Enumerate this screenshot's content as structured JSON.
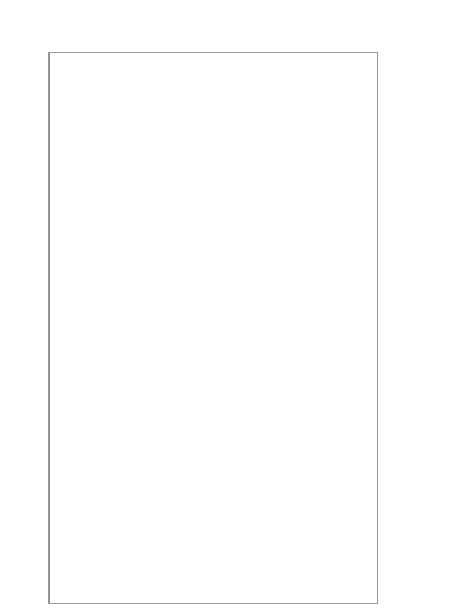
{
  "chart_data": {
    "type": "scatter",
    "subtype": "forest-plot",
    "xlabel": "",
    "ylabel": "",
    "xlim": [
      -6.6,
      6.6
    ],
    "xticks": [
      -6,
      -4,
      -2,
      0,
      2,
      4,
      6
    ],
    "xticklabels": [
      "-6",
      "-4",
      "-2",
      "0",
      "2",
      "4",
      "6"
    ],
    "grid": false,
    "legend": null,
    "reference_line": 0,
    "marker_open": "city-level estimate",
    "marker_filled": "pooled overall estimate",
    "regions": [
      {
        "name": "northwest",
        "label_y": 90
      },
      {
        "name": "southwest",
        "label_y": 155
      },
      {
        "name": "southcal",
        "label_y": 218
      },
      {
        "name": "uppermidwest",
        "label_y": 261
      },
      {
        "name": "industmidwest",
        "label_y": 325
      },
      {
        "name": "northeast",
        "label_y": 432
      },
      {
        "name": "southeast",
        "label_y": 553
      }
    ],
    "region_separators_y": [
      131,
      181,
      230,
      263,
      370,
      452,
      595
    ],
    "points": [
      {
        "city": "seat",
        "est": 0.3,
        "lo": -1.0,
        "hi": 1.5,
        "pooled": false
      },
      {
        "city": "sanj",
        "est": 0.05,
        "lo": -1.4,
        "hi": 1.4,
        "pooled": false
      },
      {
        "city": "oakl",
        "est": 1.75,
        "lo": -0.75,
        "hi": 4.25,
        "pooled": false
      },
      {
        "city": "denv",
        "est": 0.65,
        "lo": -0.9,
        "hi": 2.3,
        "pooled": false
      },
      {
        "city": "sacr",
        "est": -1.2,
        "lo": -3.4,
        "hi": 0.6,
        "pooled": false
      },
      {
        "city": "saff",
        "est": -0.75,
        "lo": -2.5,
        "hi": 0.55,
        "pooled": false
      },
      {
        "city": "taco",
        "est": 0.9,
        "lo": -1.4,
        "hi": 2.95,
        "pooled": false
      },
      {
        "city": "stoc",
        "est": -1.55,
        "lo": -4.0,
        "hi": 1.35,
        "pooled": false
      },
      {
        "city": "colo",
        "est": 3.05,
        "lo": -0.1,
        "hi": 6.7,
        "pooled": false
      },
      {
        "city": "mode",
        "est": -1.9,
        "lo": -5.1,
        "hi": 1.1,
        "pooled": false
      },
      {
        "city": "spok",
        "est": 0.3,
        "lo": -1.0,
        "hi": 1.2,
        "pooled": false
      },
      {
        "city": "olym",
        "est": 0.95,
        "lo": -1.3,
        "hi": 3.2,
        "pooled": false
      },
      {
        "city": "overall",
        "est": 0.22,
        "lo": -0.35,
        "hi": 0.8,
        "pooled": true
      },
      {
        "city": "phoe",
        "est": 0.05,
        "lo": -1.15,
        "hi": 1.3,
        "pooled": false
      },
      {
        "city": "sana",
        "est": 0.75,
        "lo": -0.95,
        "hi": 2.4,
        "pooled": false
      },
      {
        "city": "okla",
        "est": 0.55,
        "lo": -1.5,
        "hi": 1.95,
        "pooled": false
      },
      {
        "city": "elpa",
        "est": 0.2,
        "lo": -1.4,
        "hi": 1.6,
        "pooled": false
      },
      {
        "city": "aust",
        "est": 1.45,
        "lo": -1.65,
        "hi": 4.35,
        "pooled": false
      },
      {
        "city": "albu",
        "est": 0.25,
        "lo": -2.2,
        "hi": 3.9,
        "pooled": false
      },
      {
        "city": "corp",
        "est": -1.55,
        "lo": -4.9,
        "hi": 2.1,
        "pooled": false
      },
      {
        "city": "lubb",
        "est": -1.35,
        "lo": -3.25,
        "hi": 1.75,
        "pooled": false
      },
      {
        "city": "overall",
        "est": 0.3,
        "lo": -0.3,
        "hi": 0.92,
        "pooled": true
      },
      {
        "city": "la",
        "est": 0.18,
        "lo": -0.55,
        "hi": 0.9,
        "pooled": false
      },
      {
        "city": "sand",
        "est": 0.92,
        "lo": -0.7,
        "hi": 2.55,
        "pooled": false
      },
      {
        "city": "staa",
        "est": 0.1,
        "lo": -1.1,
        "hi": 1.35,
        "pooled": false
      },
      {
        "city": "sanb",
        "est": 0.05,
        "lo": -1.6,
        "hi": 1.7,
        "pooled": false
      },
      {
        "city": "rive",
        "est": 0.0,
        "lo": -1.45,
        "hi": 1.45,
        "pooled": false
      },
      {
        "city": "fres",
        "est": 0.7,
        "lo": -1.25,
        "hi": 2.7,
        "pooled": false
      },
      {
        "city": "baku",
        "est": 0.35,
        "lo": -1.7,
        "hi": 2.45,
        "pooled": false
      },
      {
        "city": "overall",
        "est": 0.26,
        "lo": -0.22,
        "hi": 0.75,
        "pooled": true
      },
      {
        "city": "minn",
        "est": 0.45,
        "lo": -0.85,
        "hi": 1.75,
        "pooled": false
      },
      {
        "city": "kans",
        "est": -0.55,
        "lo": -2.05,
        "hi": 0.9,
        "pooled": false
      },
      {
        "city": "wich",
        "est": 0.25,
        "lo": -1.7,
        "hi": 1.15,
        "pooled": false
      },
      {
        "city": "desm",
        "est": 1.25,
        "lo": -2.35,
        "hi": 5.15,
        "pooled": false
      },
      {
        "city": "oama",
        "est": -0.25,
        "lo": -2.5,
        "hi": 1.95,
        "pooled": false
      },
      {
        "city": "tope",
        "est": 0.6,
        "lo": -2.35,
        "hi": 3.35,
        "pooled": false
      },
      {
        "city": "overall",
        "est": 0.16,
        "lo": -0.5,
        "hi": 0.8,
        "pooled": true
      },
      {
        "city": "chic",
        "est": 0.3,
        "lo": -0.4,
        "hi": 1.0,
        "pooled": false
      },
      {
        "city": "det",
        "est": 0.55,
        "lo": -0.85,
        "hi": 1.95,
        "pooled": false
      },
      {
        "city": "clev",
        "est": 1.1,
        "lo": -0.95,
        "hi": 3.05,
        "pooled": false
      },
      {
        "city": "pitt",
        "est": -0.95,
        "lo": -3.0,
        "hi": 1.55,
        "pooled": false
      },
      {
        "city": "stlo",
        "est": -0.35,
        "lo": -2.1,
        "hi": 1.6,
        "pooled": false
      },
      {
        "city": "buff",
        "est": -1.05,
        "lo": -3.35,
        "hi": 1.25,
        "pooled": false
      },
      {
        "city": "cinc",
        "est": 1.95,
        "lo": -2.4,
        "hi": 6.1,
        "pooled": false
      },
      {
        "city": "cinc2",
        "est": -0.5,
        "lo": -2.0,
        "hi": 1.1,
        "pooled": false
      },
      {
        "city": "indi",
        "est": 0.05,
        "lo": -2.6,
        "hi": 2.7,
        "pooled": false
      },
      {
        "city": "loui",
        "est": 0.25,
        "lo": -2.15,
        "hi": 2.55,
        "pooled": false
      },
      {
        "city": "dayt",
        "est": 0.85,
        "lo": -1.5,
        "hi": 3.1,
        "pooled": false
      },
      {
        "city": "akr",
        "est": -0.15,
        "lo": -2.9,
        "hi": 2.35,
        "pooled": false
      },
      {
        "city": "gdrp",
        "est": 0.4,
        "lo": -2.6,
        "hi": 3.3,
        "pooled": false
      },
      {
        "city": "tole",
        "est": 0.35,
        "lo": -2.25,
        "hi": 2.9,
        "pooled": false
      },
      {
        "city": "madi",
        "est": -1.6,
        "lo": -5.25,
        "hi": 2.0,
        "pooled": false
      },
      {
        "city": "fwa",
        "est": 0.15,
        "lo": -3.3,
        "hi": 3.55,
        "pooled": false
      },
      {
        "city": "lex",
        "est": -0.3,
        "lo": -6.2,
        "hi": 5.35,
        "pooled": false
      },
      {
        "city": "evan",
        "est": 0.45,
        "lo": -3.2,
        "hi": 3.95,
        "pooled": false
      },
      {
        "city": "overall",
        "est": 0.21,
        "lo": -0.25,
        "hi": 0.7,
        "pooled": true
      },
      {
        "city": "ny",
        "est": 0.35,
        "lo": -0.25,
        "hi": 0.95,
        "pooled": false
      },
      {
        "city": "phil",
        "est": 0.95,
        "lo": -0.45,
        "hi": 2.3,
        "pooled": false
      },
      {
        "city": "nwk",
        "est": 0.65,
        "lo": -1.0,
        "hi": 2.3,
        "pooled": false
      },
      {
        "city": "balt",
        "est": 0.8,
        "lo": -0.85,
        "hi": 2.5,
        "pooled": false
      },
      {
        "city": "wor",
        "est": 1.45,
        "lo": -1.2,
        "hi": 4.1,
        "pooled": false
      },
      {
        "city": "bost",
        "est": 1.25,
        "lo": -0.55,
        "hi": 3.0,
        "pooled": false
      },
      {
        "city": "dc",
        "est": 0.7,
        "lo": -1.1,
        "hi": 2.5,
        "pooled": false
      },
      {
        "city": "prov",
        "est": 2.6,
        "lo": -0.8,
        "hi": 5.9,
        "pooled": false
      },
      {
        "city": "jers",
        "est": 0.5,
        "lo": -1.9,
        "hi": 2.95,
        "pooled": false
      },
      {
        "city": "syra",
        "est": 0.2,
        "lo": -2.4,
        "hi": 2.85,
        "pooled": false
      },
      {
        "city": "roch",
        "est": 1.95,
        "lo": -1.5,
        "hi": 5.1,
        "pooled": false
      },
      {
        "city": "rich",
        "est": 0.45,
        "lo": -2.3,
        "hi": 3.1,
        "pooled": false
      },
      {
        "city": "arlv",
        "est": 0.65,
        "lo": -2.7,
        "hi": 4.0,
        "pooled": false
      },
      {
        "city": "king",
        "est": -2.4,
        "lo": -6.5,
        "hi": 2.15,
        "pooled": false
      },
      {
        "city": "knox",
        "est": 0.3,
        "lo": -3.0,
        "hi": 3.4,
        "pooled": false
      },
      {
        "city": "overall",
        "est": 0.54,
        "lo": 0.1,
        "hi": 1.0,
        "pooled": true
      },
      {
        "city": "atl",
        "est": 0.05,
        "lo": -1.2,
        "hi": 1.35,
        "pooled": false
      },
      {
        "city": "hous",
        "est": 0.35,
        "lo": -0.95,
        "hi": 1.6,
        "pooled": false
      },
      {
        "city": "miam",
        "est": 0.2,
        "lo": -1.25,
        "hi": 1.7,
        "pooled": false
      },
      {
        "city": "stpe",
        "est": 1.4,
        "lo": -0.6,
        "hi": 3.3,
        "pooled": false
      },
      {
        "city": "tamp",
        "est": 1.25,
        "lo": -1.3,
        "hi": 3.45,
        "pooled": false
      },
      {
        "city": "memp",
        "est": 0.85,
        "lo": -1.55,
        "hi": 3.2,
        "pooled": false
      },
      {
        "city": "orla",
        "est": 1.6,
        "lo": -1.2,
        "hi": 4.3,
        "pooled": false
      },
      {
        "city": "jckv",
        "est": -0.85,
        "lo": -3.0,
        "hi": 1.35,
        "pooled": false
      },
      {
        "city": "birm",
        "est": 0.95,
        "lo": -1.6,
        "hi": 3.2,
        "pooled": false
      },
      {
        "city": "char",
        "est": -0.3,
        "lo": -3.4,
        "hi": 1.8,
        "pooled": false
      },
      {
        "city": "nash",
        "est": -0.25,
        "lo": -3.7,
        "hi": 3.1,
        "pooled": false
      },
      {
        "city": "tulk",
        "est": 0.1,
        "lo": -2.15,
        "hi": 3.4,
        "pooled": false
      },
      {
        "city": "ral",
        "est": -2.9,
        "lo": -6.4,
        "hi": 1.2,
        "pooled": false
      },
      {
        "city": "bato",
        "est": -1.7,
        "lo": -5.3,
        "hi": 1.95,
        "pooled": false
      },
      {
        "city": "lttk",
        "est": -0.7,
        "lo": -4.1,
        "hi": 2.2,
        "pooled": false
      },
      {
        "city": "gnsb",
        "est": 2.25,
        "lo": -1.1,
        "hi": 6.15,
        "pooled": false
      },
      {
        "city": "shre",
        "est": -2.15,
        "lo": -5.4,
        "hi": 1.15,
        "pooled": false
      },
      {
        "city": "jcks",
        "est": 0.4,
        "lo": -1.5,
        "hi": 2.45,
        "pooled": false
      },
      {
        "city": "hunt",
        "est": 0.26,
        "lo": -0.28,
        "hi": 0.82,
        "pooled": true
      },
      {
        "city": "overall",
        "est": 0.28,
        "lo": -0.18,
        "hi": 0.78,
        "pooled": true
      }
    ]
  }
}
